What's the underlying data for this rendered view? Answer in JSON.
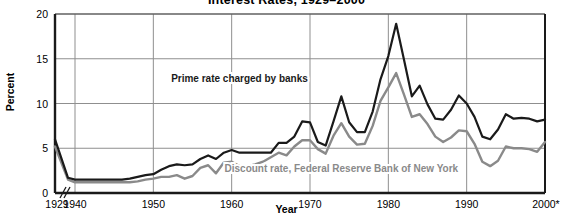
{
  "chart_data": {
    "type": "line",
    "title": "Interest Rates, 1929–2000",
    "xlabel": "Year",
    "ylabel": "Percent",
    "ylim": [
      0,
      20
    ],
    "yticks": [
      0,
      5,
      10,
      15,
      20
    ],
    "xticks": [
      "1929",
      "1940",
      "1950",
      "1960",
      "1970",
      "1980",
      "1990",
      "2000*"
    ],
    "xlim": [
      1929,
      2000
    ],
    "axis_break": "//",
    "axis_break_note": "break in x-axis between 1929 and 1940",
    "grid": "horizontal and vertical gridlines at ticks",
    "legend": "inline labels on plot",
    "series": [
      {
        "name": "Prime rate charged by banks",
        "color": "#1a1a1a",
        "label_x": 1961,
        "label_y": 12.4,
        "x": [
          1929,
          1933,
          1940,
          1941,
          1942,
          1943,
          1944,
          1945,
          1946,
          1947,
          1948,
          1949,
          1950,
          1951,
          1952,
          1953,
          1954,
          1955,
          1956,
          1957,
          1958,
          1959,
          1960,
          1961,
          1962,
          1963,
          1964,
          1965,
          1966,
          1967,
          1968,
          1969,
          1970,
          1971,
          1972,
          1973,
          1974,
          1975,
          1976,
          1977,
          1978,
          1979,
          1980,
          1981,
          1982,
          1983,
          1984,
          1985,
          1986,
          1987,
          1988,
          1989,
          1990,
          1991,
          1992,
          1993,
          1994,
          1995,
          1996,
          1997,
          1998,
          1999,
          2000
        ],
        "values": [
          6.0,
          1.7,
          1.5,
          1.5,
          1.5,
          1.5,
          1.5,
          1.5,
          1.5,
          1.6,
          1.8,
          2.0,
          2.1,
          2.6,
          3.0,
          3.2,
          3.1,
          3.2,
          3.8,
          4.2,
          3.8,
          4.5,
          4.8,
          4.5,
          4.5,
          4.5,
          4.5,
          4.5,
          5.6,
          5.6,
          6.3,
          8.0,
          7.9,
          5.7,
          5.3,
          8.0,
          10.8,
          7.9,
          6.8,
          6.8,
          9.1,
          12.7,
          15.3,
          18.9,
          14.9,
          10.8,
          12.0,
          9.9,
          8.3,
          8.2,
          9.3,
          10.9,
          10.0,
          8.5,
          6.3,
          6.0,
          7.1,
          8.8,
          8.3,
          8.4,
          8.3,
          8.0,
          8.2
        ]
      },
      {
        "name": "Discount rate, Federal Reserve Bank of New York",
        "color": "#8a8a8a",
        "label_x": 1974,
        "label_y": 2.4,
        "x": [
          1929,
          1933,
          1940,
          1941,
          1942,
          1943,
          1944,
          1945,
          1946,
          1947,
          1948,
          1949,
          1950,
          1951,
          1952,
          1953,
          1954,
          1955,
          1956,
          1957,
          1958,
          1959,
          1960,
          1961,
          1962,
          1963,
          1964,
          1965,
          1966,
          1967,
          1968,
          1969,
          1970,
          1971,
          1972,
          1973,
          1974,
          1975,
          1976,
          1977,
          1978,
          1979,
          1980,
          1981,
          1982,
          1983,
          1984,
          1985,
          1986,
          1987,
          1988,
          1989,
          1990,
          1991,
          1992,
          1993,
          1994,
          1995,
          1996,
          1997,
          1998,
          1999,
          2000
        ],
        "values": [
          5.2,
          1.5,
          1.2,
          1.2,
          1.2,
          1.2,
          1.2,
          1.2,
          1.2,
          1.2,
          1.3,
          1.5,
          1.6,
          1.8,
          1.8,
          2.0,
          1.6,
          1.9,
          2.8,
          3.1,
          2.2,
          3.4,
          3.5,
          3.0,
          3.0,
          3.2,
          3.5,
          4.0,
          4.5,
          4.2,
          5.2,
          5.9,
          5.9,
          4.9,
          4.4,
          6.4,
          7.8,
          6.3,
          5.4,
          5.5,
          7.5,
          10.3,
          11.8,
          13.4,
          11.0,
          8.5,
          8.8,
          7.7,
          6.3,
          5.7,
          6.2,
          7.0,
          6.9,
          5.5,
          3.5,
          3.0,
          3.6,
          5.2,
          5.0,
          5.0,
          4.9,
          4.6,
          5.7
        ]
      }
    ]
  }
}
